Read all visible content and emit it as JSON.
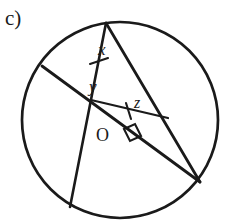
{
  "figure": {
    "part_label": "c)",
    "background_color": "#ffffff",
    "ink_color": "#1a1a1a",
    "width": 225,
    "height": 223,
    "circle": {
      "name": "circle",
      "cx": 120,
      "cy": 120,
      "r": 98,
      "stroke_width": 2.6
    },
    "points": {
      "top": {
        "label": "top-vertex",
        "x": 106,
        "y": 23
      },
      "left": {
        "label": "left-vertex",
        "x": 42,
        "y": 66
      },
      "bottom_left": {
        "label": "bottom-left-vertex",
        "x": 70,
        "y": 207
      },
      "right": {
        "label": "right-vertex",
        "x": 200,
        "y": 182
      },
      "intersection": {
        "label": "intersection-point",
        "x": 91,
        "y": 100
      },
      "chord_end": {
        "label": "chord-end-point",
        "x": 168,
        "y": 118
      },
      "centre": {
        "label": "circle-centre",
        "x": 105,
        "y": 134
      }
    },
    "segments": [
      {
        "name": "segment-top-to-bottom-left",
        "x1": 106,
        "y1": 23,
        "x2": 70,
        "y2": 207
      },
      {
        "name": "segment-top-to-right",
        "x1": 106,
        "y1": 23,
        "x2": 200,
        "y2": 182
      },
      {
        "name": "segment-left-to-right",
        "x1": 42,
        "y1": 66,
        "x2": 200,
        "y2": 182
      },
      {
        "name": "segment-intersection-to-chord-end",
        "x1": 91,
        "y1": 100,
        "x2": 168,
        "y2": 118
      },
      {
        "name": "segment-intersection-to-bottom-left",
        "x1": 91,
        "y1": 100,
        "x2": 70,
        "y2": 207
      }
    ],
    "tick_marks": [
      {
        "name": "tick-mark-on-x-segment",
        "x": 98,
        "y": 62
      },
      {
        "name": "tick-mark-on-z-chord",
        "x": 129,
        "y": 110
      }
    ],
    "right_angle": {
      "name": "right-angle-marker",
      "x": 131,
      "y": 134,
      "size": 13
    },
    "labels": {
      "angle_x": "x",
      "angle_y": "y",
      "angle_z": "z",
      "centre": "O"
    }
  }
}
